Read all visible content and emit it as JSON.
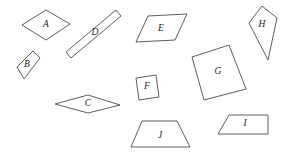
{
  "figure": {
    "background_color": "#ffffff",
    "stroke_color": "#4a4a4a",
    "label_color": "#1a1a1a",
    "width": 287,
    "height": 155
  },
  "shapes": [
    {
      "id": "A",
      "label": "A",
      "kind": "parallelogram",
      "points": "22,25 46,10 70,24 46,40",
      "label_x": 46,
      "label_y": 25
    },
    {
      "id": "B",
      "label": "B",
      "kind": "parallelogram",
      "points": "17,67 33,51 40,58 24,79",
      "label_x": 27,
      "label_y": 65
    },
    {
      "id": "C",
      "label": "C",
      "kind": "rhombus",
      "points": "55,104 88,95 120,105 88,113",
      "label_x": 88,
      "label_y": 104
    },
    {
      "id": "D",
      "label": "D",
      "kind": "parallelogram",
      "points": "66,52 116,10 121,16 71,58",
      "label_x": 95,
      "label_y": 33
    },
    {
      "id": "E",
      "label": "E",
      "kind": "parallelogram",
      "points": "136,42 148,16 187,14 175,40",
      "label_x": 161,
      "label_y": 29
    },
    {
      "id": "F",
      "label": "F",
      "kind": "square",
      "points": "136,78 156,75 159,97 139,100",
      "label_x": 147,
      "label_y": 87
    },
    {
      "id": "G",
      "label": "G",
      "kind": "square",
      "points": "192,57 229,45 246,89 204,100",
      "label_x": 218,
      "label_y": 72
    },
    {
      "id": "H",
      "label": "H",
      "kind": "kite",
      "points": "249,23 262,6 277,18 268,60",
      "label_x": 262,
      "label_y": 25
    },
    {
      "id": "I",
      "label": "I",
      "kind": "parallelogram",
      "points": "218,134 229,115 268,115 268,134",
      "label_x": 245,
      "label_y": 124
    },
    {
      "id": "J",
      "label": "J",
      "kind": "trapezoid",
      "points": "131,147 142,121 177,121 190,147",
      "label_x": 160,
      "label_y": 136
    }
  ]
}
